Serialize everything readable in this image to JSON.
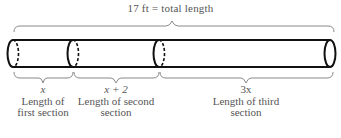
{
  "title": "17 ft = total length",
  "total_length": "17 ft",
  "sections": [
    {
      "expression": "x",
      "description_line1": "Length of",
      "description_line2": "first section"
    },
    {
      "expression": "x + 2",
      "description_line1": "Length of second",
      "description_line2": "section"
    },
    {
      "expression": "3x",
      "description_line1": "Length of third",
      "description_line2": "section"
    }
  ],
  "colors": {
    "pipe": "#111111",
    "brace": "#888888",
    "text": "#555555"
  }
}
